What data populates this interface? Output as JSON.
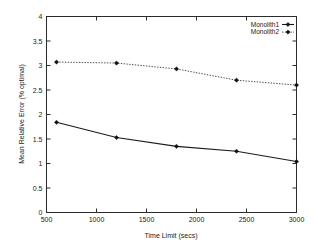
{
  "chart_data": {
    "type": "line",
    "title": "",
    "xlabel": "Time Limit (secs)",
    "ylabel": "Mean Relative Error (% optimal)",
    "xlim": [
      500,
      3000
    ],
    "ylim": [
      0,
      4
    ],
    "grid": false,
    "legend_position": "top-right",
    "x": [
      600,
      1200,
      1800,
      2400,
      3000
    ],
    "xticks": [
      "500",
      "1000",
      "1500",
      "2000",
      "2500",
      "3000"
    ],
    "xtick_values": [
      500,
      1000,
      1500,
      2000,
      2500,
      3000
    ],
    "yticks": [
      "0",
      "0.5",
      "1",
      "1.5",
      "2",
      "2.5",
      "3",
      "3.5",
      "4"
    ],
    "ytick_values": [
      0,
      0.5,
      1,
      1.5,
      2,
      2.5,
      3,
      3.5,
      4
    ],
    "series": [
      {
        "name": "Monolith1",
        "style": "solid",
        "marker": "filled-diamond",
        "color": "#111111",
        "values": [
          1.84,
          1.53,
          1.35,
          1.25,
          1.04
        ]
      },
      {
        "name": "Monolith2",
        "style": "dotted",
        "marker": "filled-diamond",
        "color": "#3a3a3a",
        "values": [
          3.07,
          3.05,
          2.93,
          2.7,
          2.6
        ]
      }
    ]
  },
  "legend": {
    "entries": [
      {
        "label": "Monolith1"
      },
      {
        "label": "Monolith2"
      }
    ]
  },
  "axes": {
    "x_title": "Time Limit (secs)",
    "y_title": "Mean Relative Error (% optimal)"
  }
}
